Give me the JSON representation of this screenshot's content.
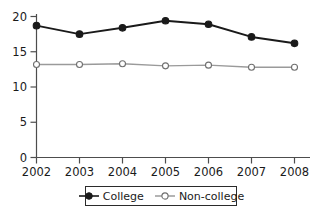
{
  "chart_data": {
    "type": "line",
    "title": "",
    "subtitle": "",
    "xlabel": "",
    "ylabel": "",
    "categories": [
      "2002",
      "2003",
      "2004",
      "2005",
      "2006",
      "2007",
      "2008"
    ],
    "x": [
      2002,
      2003,
      2004,
      2005,
      2006,
      2007,
      2008
    ],
    "series": [
      {
        "name": "College",
        "values": [
          18.7,
          17.5,
          18.4,
          19.4,
          18.9,
          17.1,
          16.2
        ],
        "marker": "filled-circle",
        "color": "#1a1a1a"
      },
      {
        "name": "Non-college",
        "values": [
          13.2,
          13.2,
          13.3,
          13.0,
          13.1,
          12.8,
          12.8
        ],
        "marker": "open-circle",
        "color": "#8c8c8c"
      }
    ],
    "ylim": [
      0,
      20
    ],
    "xlim": [
      2002,
      2008
    ],
    "yticks": [
      0,
      5,
      10,
      15,
      20
    ],
    "ytick_labels": [
      "0",
      "5",
      "10",
      "15",
      "20"
    ],
    "xtick_labels": [
      "2002",
      "2003",
      "2004",
      "2005",
      "2006",
      "2007",
      "2008"
    ],
    "grid": false,
    "legend_position": "bottom-center"
  },
  "legend": {
    "entries": [
      {
        "label": "College",
        "marker": "filled-circle-marker-icon"
      },
      {
        "label": "Non-college",
        "marker": "open-circle-marker-icon"
      }
    ]
  },
  "colors": {
    "college_line": "#1a1a1a",
    "noncollege_line": "#8c8c8c",
    "axis": "#4d4d4d",
    "background": "#ffffff",
    "legend_border": "#2b2b2b"
  }
}
